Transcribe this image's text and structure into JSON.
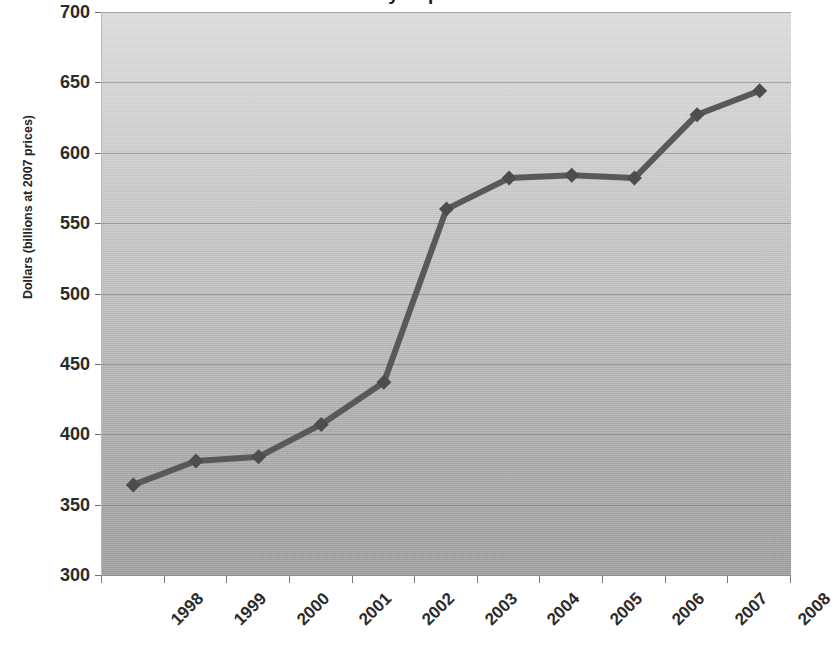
{
  "chart_data": {
    "type": "line",
    "title": "Canadian Industry Exports at 2007 Prices 2008",
    "xlabel": "",
    "ylabel": "Dollars (billions at 2007 prices)",
    "categories": [
      "1998",
      "1999",
      "2000",
      "2001",
      "2002",
      "2003",
      "2004",
      "2005",
      "2006",
      "2007",
      "2008"
    ],
    "values": [
      364,
      381,
      384,
      407,
      437,
      560,
      582,
      584,
      582,
      627,
      644
    ],
    "series": [
      {
        "name": "Exports",
        "values": [
          364,
          381,
          384,
          407,
          437,
          560,
          582,
          584,
          582,
          627,
          644
        ]
      }
    ],
    "ylim": [
      300,
      700
    ],
    "y_ticks": [
      300,
      350,
      400,
      450,
      500,
      550,
      600,
      650,
      700
    ],
    "y_tick_labels": [
      "300",
      "350",
      "400",
      "450",
      "500",
      "550",
      "600",
      "650",
      "700"
    ],
    "grid": true,
    "legend": "none",
    "line_color": "#595959",
    "marker": "diamond",
    "marker_color": "#4d4d4d",
    "plot_bg_top": "#dcdcdc",
    "plot_bg_bottom": "#9b9b9b",
    "x_label_rotation": -45
  },
  "axes": {
    "y_title": "Dollars (billions at 2007 prices)"
  }
}
